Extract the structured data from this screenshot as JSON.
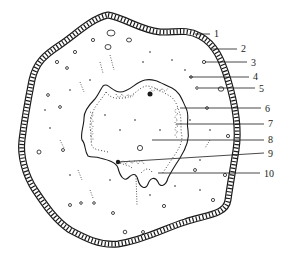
{
  "diagram": {
    "type": "cross-section",
    "stroke_color": "#1a1a1a",
    "background": "#ffffff",
    "labels": [
      {
        "id": "1",
        "text": "1",
        "x": 214,
        "y": 37,
        "line": [
          195,
          34,
          210,
          34
        ]
      },
      {
        "id": "2",
        "text": "2",
        "x": 241,
        "y": 52,
        "line": [
          210,
          49,
          237,
          49
        ]
      },
      {
        "id": "3",
        "text": "3",
        "x": 251,
        "y": 66,
        "line": [
          205,
          62,
          247,
          62
        ]
      },
      {
        "id": "4",
        "text": "4",
        "x": 253,
        "y": 80,
        "line": [
          189,
          77,
          249,
          77
        ]
      },
      {
        "id": "5",
        "text": "5",
        "x": 259,
        "y": 92,
        "line": [
          199,
          88,
          255,
          88
        ]
      },
      {
        "id": "6",
        "text": "6",
        "x": 265,
        "y": 112,
        "line": [
          180,
          108,
          261,
          108
        ]
      },
      {
        "id": "7",
        "text": "7",
        "x": 268,
        "y": 127,
        "line": [
          176,
          124,
          264,
          124
        ]
      },
      {
        "id": "8",
        "text": "8",
        "x": 268,
        "y": 143,
        "line": [
          152,
          140,
          264,
          140
        ]
      },
      {
        "id": "9",
        "text": "9",
        "x": 268,
        "y": 157,
        "line": [
          118,
          162,
          264,
          153
        ]
      },
      {
        "id": "10",
        "text": "10",
        "x": 264,
        "y": 177,
        "line": [
          158,
          173,
          260,
          173
        ]
      }
    ]
  }
}
